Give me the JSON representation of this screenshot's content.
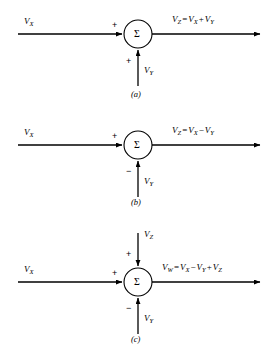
{
  "figure": {
    "type": "signal-flow-summing-junction-diagram",
    "background_color": "#ffffff",
    "line_color": "#000000",
    "operator_symbol": "Σ",
    "panels": [
      {
        "caption": "(a)",
        "left_input": {
          "label": "V",
          "sub": "X",
          "sign": "+"
        },
        "bottom_input": {
          "label": "V",
          "sub": "Y",
          "sign": "+"
        },
        "top_input": null,
        "output": {
          "result": "V",
          "result_sub": "Z",
          "eq": "=",
          "term1": "V",
          "term1_sub": "X",
          "op1": "+",
          "term2": "V",
          "term2_sub": "Y"
        }
      },
      {
        "caption": "(b)",
        "left_input": {
          "label": "V",
          "sub": "X",
          "sign": "+"
        },
        "bottom_input": {
          "label": "V",
          "sub": "Y",
          "sign": "−"
        },
        "top_input": null,
        "output": {
          "result": "V",
          "result_sub": "Z",
          "eq": "=",
          "term1": "V",
          "term1_sub": "X",
          "op1": "−",
          "term2": "V",
          "term2_sub": "Y"
        }
      },
      {
        "caption": "(c)",
        "left_input": {
          "label": "V",
          "sub": "X",
          "sign": "+"
        },
        "bottom_input": {
          "label": "V",
          "sub": "Y",
          "sign": "−"
        },
        "top_input": {
          "label": "V",
          "sub": "Z",
          "sign": "+"
        },
        "output": {
          "result": "V",
          "result_sub": "W",
          "eq": "=",
          "term1": "V",
          "term1_sub": "X",
          "op1": "−",
          "term2": "V",
          "term2_sub": "Y",
          "op2": "+",
          "term3": "V",
          "term3_sub": "Z"
        }
      }
    ]
  }
}
